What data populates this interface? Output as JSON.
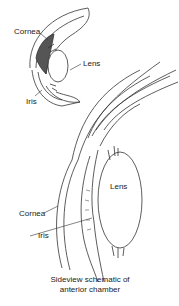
{
  "diagram": {
    "type": "anatomical-illustration",
    "inset": {
      "labels": {
        "cornea": "Cornea",
        "lens": "Lens",
        "iris": "Iris"
      }
    },
    "main": {
      "labels": {
        "lens": "Lens",
        "cornea": "Cornea",
        "iris": "Iris"
      }
    },
    "caption_line1": "Sideview schematic of",
    "caption_line2": "anterior chamber",
    "colors": {
      "line": "#333333",
      "shade": "#555555",
      "background": "#ffffff"
    }
  }
}
